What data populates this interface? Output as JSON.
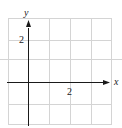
{
  "diagram": {
    "type": "coordinate-grid",
    "x_axis_label": "x",
    "y_axis_label": "y",
    "x_tick_label": "2",
    "y_tick_label": "2",
    "grid": {
      "columns": 5,
      "rows": 5,
      "x_range": [
        -1,
        4
      ],
      "y_range": [
        -2,
        3
      ],
      "unit_per_cell": 1
    },
    "colors": {
      "grid": "#d4d4d4",
      "axis": "#1a1a1a",
      "background": "#ffffff"
    }
  }
}
